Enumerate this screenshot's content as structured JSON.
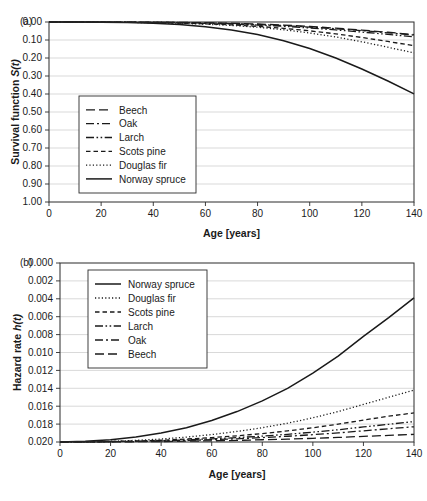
{
  "figure": {
    "panels": [
      {
        "tag": "(a)",
        "xlabel": "Age [years]",
        "ylabel_main": "Survival function ",
        "ylabel_italic": "S(t)",
        "yticks": [
          "1.00",
          "0.90",
          "0.80",
          "0.70",
          "0.60",
          "0.50",
          "0.40",
          "0.30",
          "0.20",
          "0.10",
          "0.00"
        ],
        "xticks": [
          "0",
          "20",
          "40",
          "60",
          "80",
          "100",
          "120",
          "140"
        ]
      },
      {
        "tag": "(b)",
        "xlabel": "Age [years]",
        "ylabel_main": "Hazard rate ",
        "ylabel_italic": "h(t)",
        "yticks": [
          "0.020",
          "0.018",
          "0.016",
          "0.014",
          "0.012",
          "0.010",
          "0.008",
          "0.006",
          "0.004",
          "0.002",
          "0.000"
        ],
        "xticks": [
          "0",
          "20",
          "40",
          "60",
          "80",
          "100",
          "120",
          "140"
        ]
      }
    ]
  },
  "chart_data": [
    {
      "type": "line",
      "panel": "(a)",
      "title": "",
      "xlabel": "Age [years]",
      "ylabel": "Survival function S(t)",
      "xlim": [
        0,
        140
      ],
      "ylim": [
        0,
        1
      ],
      "xticks": [
        0,
        20,
        40,
        60,
        80,
        100,
        120,
        140
      ],
      "yticks": [
        0.0,
        0.1,
        0.2,
        0.3,
        0.4,
        0.5,
        0.6,
        0.7,
        0.8,
        0.9,
        1.0
      ],
      "grid": "horizontal",
      "legend_position": "center-left",
      "x": [
        0,
        10,
        20,
        30,
        40,
        50,
        60,
        70,
        80,
        90,
        100,
        110,
        120,
        130,
        140
      ],
      "series": [
        {
          "name": "Beech",
          "dash": "9,4",
          "width": 1.3,
          "values": [
            1.0,
            1.0,
            1.0,
            0.999,
            0.999,
            0.998,
            0.996,
            0.993,
            0.989,
            0.983,
            0.975,
            0.966,
            0.955,
            0.943,
            0.93
          ]
        },
        {
          "name": "Oak",
          "dash": "8,3,2,3",
          "width": 1.3,
          "values": [
            1.0,
            1.0,
            1.0,
            0.999,
            0.998,
            0.997,
            0.995,
            0.991,
            0.986,
            0.98,
            0.972,
            0.963,
            0.952,
            0.94,
            0.927
          ]
        },
        {
          "name": "Larch",
          "dash": "8,2.5,1.6,2.5,1.6,2.5",
          "width": 1.3,
          "values": [
            1.0,
            1.0,
            0.999,
            0.999,
            0.998,
            0.996,
            0.993,
            0.989,
            0.983,
            0.976,
            0.967,
            0.956,
            0.944,
            0.931,
            0.918
          ]
        },
        {
          "name": "Scots pine",
          "dash": "4.5,3",
          "width": 1.3,
          "values": [
            1.0,
            1.0,
            0.999,
            0.998,
            0.997,
            0.994,
            0.99,
            0.984,
            0.976,
            0.965,
            0.951,
            0.934,
            0.914,
            0.892,
            0.868
          ]
        },
        {
          "name": "Douglas fir",
          "dash": "1.2,2.2",
          "width": 1.3,
          "values": [
            1.0,
            1.0,
            0.999,
            0.998,
            0.996,
            0.993,
            0.988,
            0.981,
            0.971,
            0.957,
            0.939,
            0.917,
            0.89,
            0.86,
            0.828
          ]
        },
        {
          "name": "Norway spruce",
          "dash": "none",
          "width": 1.5,
          "values": [
            1.0,
            1.0,
            0.999,
            0.997,
            0.993,
            0.986,
            0.974,
            0.956,
            0.93,
            0.896,
            0.853,
            0.8,
            0.739,
            0.672,
            0.601
          ]
        }
      ]
    },
    {
      "type": "line",
      "panel": "(b)",
      "title": "",
      "xlabel": "Age [years]",
      "ylabel": "Hazard rate h(t)",
      "xlim": [
        0,
        140
      ],
      "ylim": [
        0,
        0.02
      ],
      "xticks": [
        0,
        20,
        40,
        60,
        80,
        100,
        120,
        140
      ],
      "yticks": [
        0.0,
        0.002,
        0.004,
        0.006,
        0.008,
        0.01,
        0.012,
        0.014,
        0.016,
        0.018,
        0.02
      ],
      "grid": "horizontal",
      "legend_position": "upper-left",
      "x": [
        0,
        10,
        20,
        30,
        40,
        50,
        60,
        70,
        80,
        90,
        100,
        110,
        120,
        130,
        140
      ],
      "series": [
        {
          "name": "Norway spruce",
          "dash": "none",
          "width": 1.5,
          "values": [
            0.0,
            7e-05,
            0.00025,
            0.00055,
            0.001,
            0.0016,
            0.0024,
            0.0034,
            0.0046,
            0.006,
            0.0077,
            0.0096,
            0.0118,
            0.0139,
            0.0161
          ]
        },
        {
          "name": "Douglas fir",
          "dash": "1.2,2.2",
          "width": 1.3,
          "values": [
            0.0,
            2e-05,
            8e-05,
            0.00018,
            0.00033,
            0.00055,
            0.00083,
            0.00118,
            0.0016,
            0.0021,
            0.0027,
            0.0034,
            0.0042,
            0.005,
            0.0058
          ]
        },
        {
          "name": "Scots pine",
          "dash": "4.5,3",
          "width": 1.3,
          "values": [
            0.0,
            1e-05,
            5e-05,
            0.00011,
            0.0002,
            0.00033,
            0.00049,
            0.00069,
            0.00094,
            0.00124,
            0.00159,
            0.00199,
            0.00245,
            0.00288,
            0.00325
          ]
        },
        {
          "name": "Larch",
          "dash": "8,2.5,1.6,2.5,1.6,2.5",
          "width": 1.3,
          "values": [
            0.0,
            1e-05,
            4e-05,
            8e-05,
            0.00015,
            0.00024,
            0.00035,
            0.00049,
            0.00066,
            0.00086,
            0.0011,
            0.00137,
            0.00168,
            0.00198,
            0.00228
          ]
        },
        {
          "name": "Oak",
          "dash": "8,3,2,3",
          "width": 1.3,
          "values": [
            0.0,
            1e-05,
            3e-05,
            6e-05,
            0.00011,
            0.00018,
            0.00026,
            0.00036,
            0.00049,
            0.00064,
            0.00082,
            0.00102,
            0.00125,
            0.00148,
            0.0017
          ]
        },
        {
          "name": "Beech",
          "dash": "9,4",
          "width": 1.3,
          "values": [
            0.0,
            0.0,
            1e-05,
            3e-05,
            5e-05,
            9e-05,
            0.00013,
            0.00018,
            0.00025,
            0.00032,
            0.00041,
            0.00051,
            0.00063,
            0.00074,
            0.00085
          ]
        }
      ]
    }
  ],
  "legends": [
    {
      "panel": "(a)",
      "entries": [
        {
          "label": "Beech",
          "dash": "9,4"
        },
        {
          "label": "Oak",
          "dash": "8,3,2,3"
        },
        {
          "label": "Larch",
          "dash": "8,2.5,1.6,2.5,1.6,2.5"
        },
        {
          "label": "Scots pine",
          "dash": "4.5,3"
        },
        {
          "label": "Douglas fir",
          "dash": "1.2,2.2"
        },
        {
          "label": "Norway spruce",
          "dash": "none"
        }
      ]
    },
    {
      "panel": "(b)",
      "entries": [
        {
          "label": "Norway spruce",
          "dash": "none"
        },
        {
          "label": "Douglas fir",
          "dash": "1.2,2.2"
        },
        {
          "label": "Scots pine",
          "dash": "4.5,3"
        },
        {
          "label": "Larch",
          "dash": "8,2.5,1.6,2.5,1.6,2.5"
        },
        {
          "label": "Oak",
          "dash": "8,3,2,3"
        },
        {
          "label": "Beech",
          "dash": "9,4"
        }
      ]
    }
  ]
}
